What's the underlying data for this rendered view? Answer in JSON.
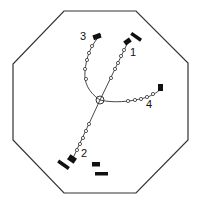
{
  "diagram": {
    "type": "octagonal-chamber-layout",
    "colors": {
      "line": "#333333",
      "fill": "#111111",
      "background": "#ffffff"
    },
    "center": {
      "x": 100,
      "y": 100,
      "r": 4
    },
    "labels": [
      {
        "id": "1",
        "text": "1",
        "x": 132,
        "y": 51
      },
      {
        "id": "2",
        "text": "2",
        "x": 82,
        "y": 152
      },
      {
        "id": "3",
        "text": "3",
        "x": 82,
        "y": 33
      },
      {
        "id": "4",
        "text": "4",
        "x": 148,
        "y": 101
      }
    ],
    "branches": [
      {
        "id": "1",
        "description": "straight line from center to upper-right block"
      },
      {
        "id": "2",
        "description": "straight line from center to lower-left block"
      },
      {
        "id": "3",
        "description": "curved line from center to upper-left block"
      },
      {
        "id": "4",
        "description": "curved line from center to right block"
      }
    ]
  }
}
